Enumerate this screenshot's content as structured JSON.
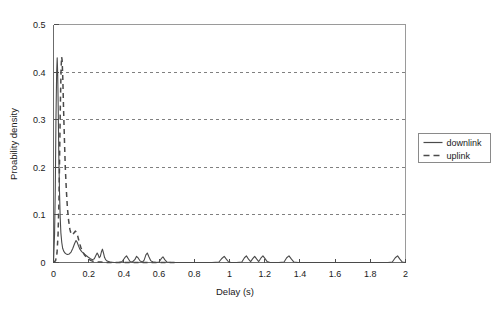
{
  "chart_data": {
    "type": "line",
    "title": "",
    "xlabel": "Delay (s)",
    "ylabel": "Proability density",
    "xlim": [
      0,
      2
    ],
    "ylim": [
      0,
      0.5
    ],
    "xticks": [
      0,
      0.2,
      0.4,
      0.6,
      0.8,
      1,
      1.2,
      1.4,
      1.6,
      1.8,
      2
    ],
    "xtick_labels": [
      "0",
      "0.2",
      "0.4",
      "0.6",
      "0.8",
      "1",
      "1.2",
      "1.4",
      "1.6",
      "1.8",
      "2"
    ],
    "yticks": [
      0,
      0.1,
      0.2,
      0.3,
      0.4,
      0.5
    ],
    "ytick_labels": [
      "0",
      "0.1",
      "0.2",
      "0.3",
      "0.4",
      "0.5"
    ],
    "grid": "horizontal-dashed",
    "gridlines_y": [
      0.1,
      0.2,
      0.3,
      0.4
    ],
    "legend_position": "right-outside",
    "series": [
      {
        "name": "downlink",
        "style": "solid",
        "color": "#4a4a4a",
        "points": [
          [
            0.0,
            0.0
          ],
          [
            0.006,
            0.06
          ],
          [
            0.01,
            0.15
          ],
          [
            0.014,
            0.3
          ],
          [
            0.018,
            0.4
          ],
          [
            0.021,
            0.43
          ],
          [
            0.024,
            0.395
          ],
          [
            0.027,
            0.32
          ],
          [
            0.03,
            0.23
          ],
          [
            0.034,
            0.15
          ],
          [
            0.038,
            0.095
          ],
          [
            0.042,
            0.062
          ],
          [
            0.047,
            0.042
          ],
          [
            0.052,
            0.03
          ],
          [
            0.058,
            0.024
          ],
          [
            0.065,
            0.02
          ],
          [
            0.072,
            0.018
          ],
          [
            0.08,
            0.017
          ],
          [
            0.09,
            0.018
          ],
          [
            0.1,
            0.022
          ],
          [
            0.11,
            0.03
          ],
          [
            0.12,
            0.04
          ],
          [
            0.128,
            0.046
          ],
          [
            0.134,
            0.043
          ],
          [
            0.142,
            0.035
          ],
          [
            0.15,
            0.028
          ],
          [
            0.16,
            0.023
          ],
          [
            0.172,
            0.019
          ],
          [
            0.185,
            0.015
          ],
          [
            0.198,
            0.011
          ],
          [
            0.21,
            0.008
          ],
          [
            0.222,
            0.006
          ],
          [
            0.232,
            0.008
          ],
          [
            0.24,
            0.014
          ],
          [
            0.248,
            0.02
          ],
          [
            0.254,
            0.016
          ],
          [
            0.26,
            0.01
          ],
          [
            0.266,
            0.013
          ],
          [
            0.272,
            0.022
          ],
          [
            0.278,
            0.028
          ],
          [
            0.284,
            0.02
          ],
          [
            0.29,
            0.011
          ],
          [
            0.296,
            0.006
          ],
          [
            0.305,
            0.003
          ],
          [
            0.32,
            0.001
          ],
          [
            0.345,
            0.0
          ],
          [
            0.37,
            0.0
          ],
          [
            0.39,
            0.002
          ],
          [
            0.405,
            0.01
          ],
          [
            0.415,
            0.014
          ],
          [
            0.425,
            0.008
          ],
          [
            0.435,
            0.002
          ],
          [
            0.448,
            0.001
          ],
          [
            0.462,
            0.006
          ],
          [
            0.472,
            0.013
          ],
          [
            0.482,
            0.009
          ],
          [
            0.492,
            0.003
          ],
          [
            0.505,
            0.001
          ],
          [
            0.515,
            0.005
          ],
          [
            0.525,
            0.016
          ],
          [
            0.533,
            0.02
          ],
          [
            0.542,
            0.012
          ],
          [
            0.552,
            0.004
          ],
          [
            0.565,
            0.001
          ],
          [
            0.585,
            0.0
          ],
          [
            0.6,
            0.001
          ],
          [
            0.612,
            0.008
          ],
          [
            0.622,
            0.012
          ],
          [
            0.632,
            0.006
          ],
          [
            0.645,
            0.001
          ],
          [
            0.67,
            0.0
          ],
          [
            0.72,
            0.0
          ],
          [
            0.78,
            0.0
          ],
          [
            0.84,
            0.0
          ],
          [
            0.9,
            0.0
          ],
          [
            0.94,
            0.001
          ],
          [
            0.958,
            0.009
          ],
          [
            0.97,
            0.013
          ],
          [
            0.982,
            0.007
          ],
          [
            0.995,
            0.001
          ],
          [
            1.01,
            0.0
          ],
          [
            1.04,
            0.0
          ],
          [
            1.07,
            0.001
          ],
          [
            1.085,
            0.01
          ],
          [
            1.096,
            0.014
          ],
          [
            1.108,
            0.007
          ],
          [
            1.12,
            0.002
          ],
          [
            1.132,
            0.008
          ],
          [
            1.143,
            0.013
          ],
          [
            1.155,
            0.007
          ],
          [
            1.166,
            0.002
          ],
          [
            1.178,
            0.009
          ],
          [
            1.19,
            0.014
          ],
          [
            1.202,
            0.008
          ],
          [
            1.214,
            0.002
          ],
          [
            1.23,
            0.0
          ],
          [
            1.28,
            0.0
          ],
          [
            1.31,
            0.001
          ],
          [
            1.325,
            0.01
          ],
          [
            1.338,
            0.014
          ],
          [
            1.352,
            0.007
          ],
          [
            1.366,
            0.001
          ],
          [
            1.39,
            0.0
          ],
          [
            1.5,
            0.0
          ],
          [
            1.6,
            0.0
          ],
          [
            1.7,
            0.0
          ],
          [
            1.8,
            0.0
          ],
          [
            1.9,
            0.0
          ],
          [
            1.925,
            0.001
          ],
          [
            1.942,
            0.01
          ],
          [
            1.955,
            0.014
          ],
          [
            1.968,
            0.007
          ],
          [
            1.982,
            0.001
          ],
          [
            2.0,
            0.0
          ]
        ]
      },
      {
        "name": "uplink",
        "style": "dashed",
        "color": "#4a4a4a",
        "points": [
          [
            0.0,
            0.0
          ],
          [
            0.012,
            0.004
          ],
          [
            0.02,
            0.02
          ],
          [
            0.026,
            0.06
          ],
          [
            0.031,
            0.13
          ],
          [
            0.035,
            0.23
          ],
          [
            0.039,
            0.33
          ],
          [
            0.043,
            0.405
          ],
          [
            0.046,
            0.432
          ],
          [
            0.049,
            0.425
          ],
          [
            0.053,
            0.385
          ],
          [
            0.057,
            0.325
          ],
          [
            0.062,
            0.26
          ],
          [
            0.067,
            0.2
          ],
          [
            0.073,
            0.152
          ],
          [
            0.079,
            0.115
          ],
          [
            0.086,
            0.088
          ],
          [
            0.093,
            0.07
          ],
          [
            0.1,
            0.06
          ],
          [
            0.108,
            0.058
          ],
          [
            0.116,
            0.062
          ],
          [
            0.124,
            0.066
          ],
          [
            0.13,
            0.064
          ],
          [
            0.138,
            0.055
          ],
          [
            0.146,
            0.043
          ],
          [
            0.155,
            0.032
          ],
          [
            0.165,
            0.023
          ],
          [
            0.176,
            0.016
          ],
          [
            0.188,
            0.011
          ],
          [
            0.2,
            0.007
          ],
          [
            0.214,
            0.004
          ],
          [
            0.23,
            0.002
          ],
          [
            0.248,
            0.001
          ],
          [
            0.27,
            0.001
          ],
          [
            0.3,
            0.0
          ],
          [
            0.35,
            0.0
          ],
          [
            0.42,
            0.0
          ],
          [
            0.5,
            0.0
          ],
          [
            0.6,
            0.0
          ],
          [
            0.7,
            0.0
          ]
        ]
      }
    ]
  },
  "legend": {
    "entries": [
      {
        "label": "downlink",
        "style": "solid"
      },
      {
        "label": "uplink",
        "style": "dashed"
      }
    ]
  }
}
